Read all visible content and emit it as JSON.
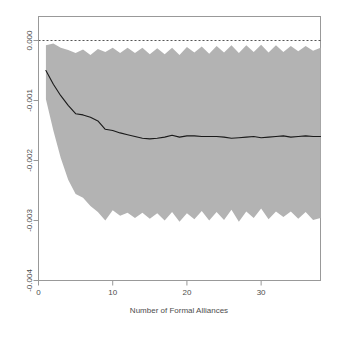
{
  "chart_data": {
    "type": "area",
    "title": "",
    "subtitle": "",
    "xlabel": "Number of Formal Alliances",
    "ylabel": "",
    "xlim": [
      0,
      38
    ],
    "ylim": [
      -0.004,
      0.0004
    ],
    "xticks": [
      0,
      10,
      20,
      30
    ],
    "xticklabels": [
      "0",
      "10",
      "20",
      "30"
    ],
    "yticks": [
      0.0,
      -0.001,
      -0.002,
      -0.003,
      -0.004
    ],
    "yticklabels": [
      "0.000",
      "-0.001",
      "-0.002",
      "-0.003",
      "-0.004"
    ],
    "grid": false,
    "legend": null,
    "reference_line": {
      "name": "zero-line",
      "y": 0.0,
      "style": "dashed",
      "color": "#555555"
    },
    "band_color": "#b3b3b3",
    "line_color": "#1a1a1a",
    "x": [
      1,
      2,
      3,
      4,
      5,
      6,
      7,
      8,
      9,
      10,
      11,
      12,
      13,
      14,
      15,
      16,
      17,
      18,
      19,
      20,
      21,
      22,
      23,
      24,
      25,
      26,
      27,
      28,
      29,
      30,
      31,
      32,
      33,
      34,
      35,
      36,
      37,
      38
    ],
    "series": [
      {
        "name": "Marginal effect (mean)",
        "values": [
          -0.0005,
          -0.00073,
          -0.00092,
          -0.00108,
          -0.00122,
          -0.00124,
          -0.00128,
          -0.00134,
          -0.00148,
          -0.0015,
          -0.00154,
          -0.00157,
          -0.0016,
          -0.00163,
          -0.00164,
          -0.00163,
          -0.00161,
          -0.00158,
          -0.00161,
          -0.00159,
          -0.00159,
          -0.0016,
          -0.0016,
          -0.0016,
          -0.00161,
          -0.00163,
          -0.00162,
          -0.00161,
          -0.0016,
          -0.00162,
          -0.00161,
          -0.0016,
          -0.00159,
          -0.00161,
          -0.0016,
          -0.00159,
          -0.0016,
          -0.0016
        ]
      },
      {
        "name": "Upper confidence bound",
        "values": [
          -8e-05,
          -5e-05,
          -0.00012,
          -0.00016,
          -0.00021,
          -0.00015,
          -0.00024,
          -0.00014,
          -0.00019,
          -0.00012,
          -0.00021,
          -0.00012,
          -0.00021,
          -0.00012,
          -0.00023,
          -0.00013,
          -0.00023,
          -0.00012,
          -0.00024,
          -0.00011,
          -0.0002,
          -0.0001,
          -0.00022,
          -9e-05,
          -0.0002,
          -8e-05,
          -0.00021,
          -8e-05,
          -0.00019,
          -7e-05,
          -0.0002,
          -8e-05,
          -0.00019,
          -9e-05,
          -0.00018,
          -9e-05,
          -0.00017,
          -0.00012
        ]
      },
      {
        "name": "Lower confidence bound",
        "values": [
          -0.00098,
          -0.0015,
          -0.00196,
          -0.00232,
          -0.00256,
          -0.00262,
          -0.00276,
          -0.00286,
          -0.003,
          -0.00283,
          -0.00292,
          -0.00287,
          -0.00296,
          -0.00287,
          -0.00297,
          -0.00288,
          -0.003,
          -0.00286,
          -0.00302,
          -0.00288,
          -0.00298,
          -0.00284,
          -0.003,
          -0.00286,
          -0.00299,
          -0.00282,
          -0.00302,
          -0.00285,
          -0.00296,
          -0.0028,
          -0.00298,
          -0.00285,
          -0.00294,
          -0.00285,
          -0.00297,
          -0.00286,
          -0.00299,
          -0.00296
        ]
      }
    ]
  },
  "axes": {
    "x_axis_name": "x-axis",
    "y_axis_name": "y-axis"
  }
}
